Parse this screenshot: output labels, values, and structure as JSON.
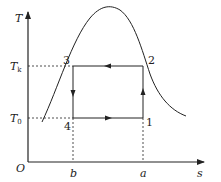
{
  "diagram": {
    "type": "T-s diagram (reversed Carnot refrigeration cycle)",
    "axes": {
      "y_label": "T",
      "x_label": "s",
      "origin_label": "O"
    },
    "y_ticks": [
      {
        "label": "T",
        "subscript": "k",
        "y": 66
      },
      {
        "label": "T",
        "subscript": "0",
        "y": 118
      }
    ],
    "x_ticks": [
      {
        "label": "b",
        "x": 73
      },
      {
        "label": "a",
        "x": 143
      }
    ],
    "points": [
      {
        "label": "1",
        "x": 143,
        "y": 118
      },
      {
        "label": "2",
        "x": 143,
        "y": 66
      },
      {
        "label": "3",
        "x": 73,
        "y": 66
      },
      {
        "label": "4",
        "x": 73,
        "y": 118
      }
    ],
    "process_directions": [
      {
        "from": "1",
        "to": "2",
        "direction": "up"
      },
      {
        "from": "2",
        "to": "3",
        "direction": "left"
      },
      {
        "from": "3",
        "to": "4",
        "direction": "down"
      },
      {
        "from": "4",
        "to": "1",
        "direction": "right"
      }
    ],
    "colors": {
      "line": "#222222",
      "background": "#ffffff"
    }
  }
}
